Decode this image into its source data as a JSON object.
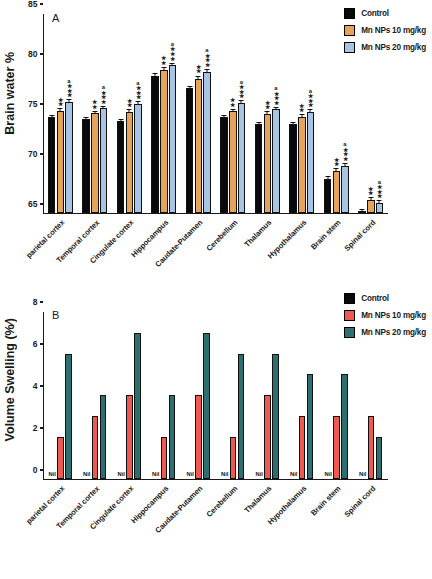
{
  "figure": {
    "categories": [
      "parietal cortex",
      "Temporal cortex",
      "Cingulate cortex",
      "Hippocampus",
      "Caudate-Putamen",
      "Cerebellum",
      "Thalamus",
      "Hypothalamus",
      "Brain stem",
      "Spinal cord"
    ],
    "colors": {
      "control": "#0a0a0a",
      "mn10_a": "#e5a35c",
      "mn20_a": "#a9c4e2",
      "mn10_b": "#ef5a50",
      "mn20_b": "#2d6e6e"
    }
  },
  "panelA": {
    "letter": "A",
    "legend": [
      {
        "label": "Control",
        "color": "#0a0a0a",
        "icon": "legend-swatch-control"
      },
      {
        "label": "Mn NPs 10 mg/kg",
        "color": "#e5a35c",
        "icon": "legend-swatch-mn10"
      },
      {
        "label": "Mn NPs 20 mg/kg",
        "color": "#a9c4e2",
        "icon": "legend-swatch-mn20"
      }
    ],
    "yticks": [
      "85",
      "80",
      "75",
      "70",
      "65"
    ]
  },
  "panelB": {
    "letter": "B",
    "legend": [
      {
        "label": "Control",
        "color": "#0a0a0a",
        "icon": "legend-swatch-control"
      },
      {
        "label": "Mn NPs 10 mg/kg",
        "color": "#ef5a50",
        "icon": "legend-swatch-mn10"
      },
      {
        "label": "Mn NPs 20 mg/kg",
        "color": "#2d6e6e",
        "icon": "legend-swatch-mn20"
      }
    ],
    "yticks": [
      "8",
      "6",
      "4",
      "2",
      "0"
    ],
    "nil_label": "Nil"
  },
  "chart_data": [
    {
      "type": "bar",
      "panel": "A",
      "title": "Brain water %",
      "xlabel": "",
      "ylabel": "Brain water %",
      "ylim": [
        65,
        85
      ],
      "yticks": [
        65,
        70,
        75,
        80,
        85
      ],
      "grid": false,
      "legend_position": "top-right",
      "categories": [
        "parietal cortex",
        "Temporal cortex",
        "Cingulate cortex",
        "Hippocampus",
        "Caudate-Putamen",
        "Cerebellum",
        "Thalamus",
        "Hypothalamus",
        "Brain stem",
        "Spinal cord"
      ],
      "series": [
        {
          "name": "Control",
          "color": "#0a0a0a",
          "values": [
            74.6,
            74.4,
            74.2,
            78.8,
            77.5,
            74.6,
            73.9,
            73.9,
            68.4,
            65.2
          ],
          "errors": [
            0.15,
            0.15,
            0.15,
            0.15,
            0.2,
            0.15,
            0.15,
            0.15,
            0.15,
            0.1
          ],
          "annotations": [
            "",
            "",
            "",
            "",
            "",
            "",
            "",
            "",
            "",
            ""
          ]
        },
        {
          "name": "Mn NPs 10 mg/kg",
          "color": "#e5a35c",
          "values": [
            75.2,
            75.0,
            75.1,
            79.4,
            78.5,
            75.2,
            74.9,
            74.6,
            69.2,
            66.3
          ],
          "errors": [
            0.2,
            0.15,
            0.2,
            0.15,
            0.2,
            0.15,
            0.2,
            0.2,
            0.15,
            0.15
          ],
          "annotations": [
            "**",
            "**",
            "**",
            "**",
            "**",
            "**",
            "**",
            "**",
            "**",
            "**"
          ]
        },
        {
          "name": "Mn NPs 20 mg/kg",
          "color": "#a9c4e2",
          "values": [
            76.1,
            75.5,
            75.9,
            79.9,
            79.2,
            76.0,
            75.4,
            75.1,
            69.7,
            66.0
          ],
          "errors": [
            0.2,
            0.15,
            0.2,
            0.1,
            0.15,
            0.2,
            0.15,
            0.2,
            0.2,
            0.15
          ],
          "annotations": [
            "a***",
            "a***",
            "a***",
            "a***",
            "a***",
            "a***",
            "a***",
            "a***",
            "a***",
            "a***"
          ]
        }
      ]
    },
    {
      "type": "bar",
      "panel": "B",
      "title": "Volume Swelling (%⁄)",
      "xlabel": "",
      "ylabel": "Volume Swelling (%⁄)",
      "ylim": [
        0,
        8
      ],
      "yticks": [
        0,
        2,
        4,
        6,
        8
      ],
      "grid": false,
      "legend_position": "top-right",
      "categories": [
        "parietal cortex",
        "Temporal cortex",
        "Cingulate cortex",
        "Hippocampus",
        "Caudate-Putamen",
        "Cerebellum",
        "Thalamus",
        "Hypothalamus",
        "Brain stem",
        "Spinal cord"
      ],
      "series": [
        {
          "name": "Control",
          "color": "#0a0a0a",
          "values": [
            0,
            0,
            0,
            0,
            0,
            0,
            0,
            0,
            0,
            0
          ],
          "value_labels": [
            "Nil",
            "Nil",
            "Nil",
            "Nil",
            "Nil",
            "Nil",
            "Nil",
            "Nil",
            "Nil",
            "Nil"
          ]
        },
        {
          "name": "Mn NPs 10 mg/kg",
          "color": "#ef5a50",
          "values": [
            2,
            3,
            4,
            2,
            4,
            2,
            4,
            3,
            3,
            3
          ]
        },
        {
          "name": "Mn NPs 20 mg/kg",
          "color": "#2d6e6e",
          "values": [
            6,
            4,
            7,
            4,
            7,
            6,
            6,
            5,
            5,
            2
          ]
        }
      ]
    }
  ]
}
